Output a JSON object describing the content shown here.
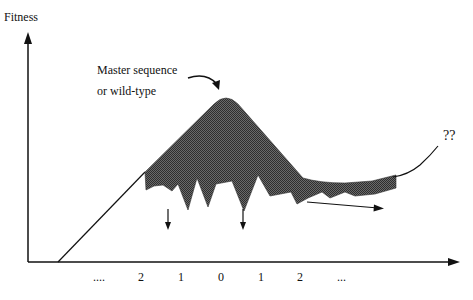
{
  "diagram": {
    "type": "fitness-landscape",
    "y_axis_label": "Fitness",
    "x_axis_ticks": [
      "....",
      "2",
      "1",
      "0",
      "1",
      "2",
      "..."
    ],
    "annotations": {
      "peak_label_line1": "Master sequence",
      "peak_label_line2": "or wild-type",
      "unknown_label": "??"
    },
    "colors": {
      "fill": "#555555",
      "line": "#111111",
      "background": "#ffffff"
    }
  }
}
